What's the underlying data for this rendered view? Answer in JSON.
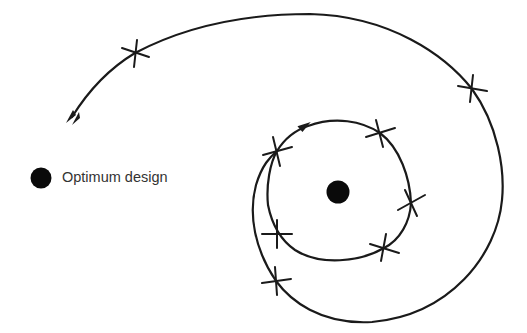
{
  "legend": {
    "marker": "filled-circle",
    "label": "Optimum design"
  },
  "diagram": {
    "optimum_point": {
      "x": 338,
      "y": 192
    },
    "start_arrow": {
      "x": 72,
      "y": 117
    },
    "iteration_marks_outer": [
      {
        "x": 135,
        "y": 53
      },
      {
        "x": 472,
        "y": 89
      },
      {
        "x": 276,
        "y": 281
      }
    ],
    "iteration_marks_inner": [
      {
        "x": 277,
        "y": 151
      },
      {
        "x": 380,
        "y": 133
      },
      {
        "x": 411,
        "y": 203
      },
      {
        "x": 384,
        "y": 248
      },
      {
        "x": 277,
        "y": 234
      }
    ],
    "colors": {
      "stroke": "#1a1a1a",
      "dot": "#0a0a0a",
      "text": "#333333"
    }
  }
}
